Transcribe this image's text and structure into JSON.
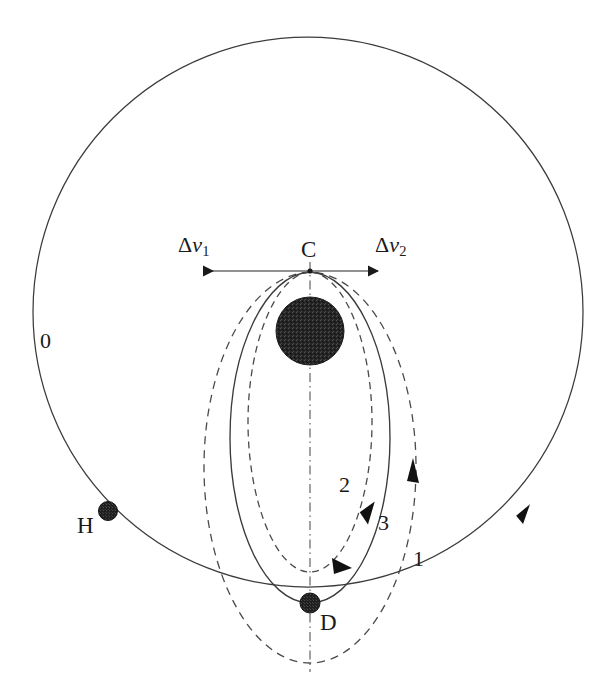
{
  "figure": {
    "background_color": "#ffffff",
    "line_color": "#333333",
    "body_color": "#2b2b2b"
  },
  "labels": {
    "orbit_outer": "0",
    "orbit_dashed_outer": "1",
    "orbit_dashed_inner": "2",
    "orbit_solid_inner": "3",
    "point_c": "C",
    "point_d": "D",
    "point_h": "H",
    "delta_v1_symbol": "Δ",
    "delta_v1_var": "v",
    "delta_v1_sub": "1",
    "delta_v2_symbol": "Δ",
    "delta_v2_var": "v",
    "delta_v2_sub": "2"
  },
  "geometry": {
    "circle_center_x": 308,
    "circle_center_y": 312,
    "circle_radius": 275,
    "body_center_x": 310,
    "body_center_y": 331,
    "body_radius": 34,
    "apex_x": 310,
    "apex_y": 272,
    "point_d_x": 310,
    "point_d_y": 603,
    "point_h_x": 108,
    "point_h_y": 511,
    "axis_top_y": 262,
    "axis_bottom_y": 672,
    "dv_arrow_y": 271,
    "dv_arrow_left_x": 204,
    "dv_arrow_right_x": 378,
    "ellipse1_semi_x": 106,
    "ellipse1_bottom_y": 663,
    "ellipse2_semi_x": 62,
    "ellipse2_bottom_y": 572,
    "ellipse3_semi_x": 80,
    "ellipse3_bottom_y": 603
  },
  "label_positions": {
    "orbit_outer": {
      "x": 40,
      "y": 330
    },
    "orbit_dashed_outer": {
      "x": 413,
      "y": 548
    },
    "orbit_dashed_inner": {
      "x": 339,
      "y": 474
    },
    "orbit_solid_inner": {
      "x": 378,
      "y": 512
    },
    "point_c": {
      "x": 301,
      "y": 238
    },
    "point_d": {
      "x": 320,
      "y": 611
    },
    "point_h": {
      "x": 77,
      "y": 514
    },
    "delta_v1": {
      "x": 178,
      "y": 234
    },
    "delta_v2": {
      "x": 375,
      "y": 234
    }
  }
}
